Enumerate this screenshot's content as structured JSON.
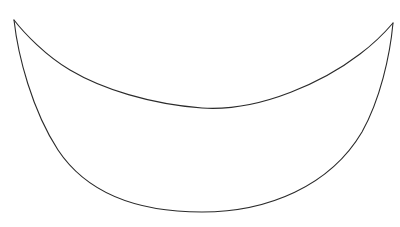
{
  "image": {
    "kind": "line-drawing",
    "subject": "crescent-lens-shape",
    "width": 400,
    "height": 227,
    "background_color": "#ffffff",
    "stroke_color": "#2b2b2b",
    "stroke_color_light": "#555555",
    "stroke_width": 1.1,
    "text_content": "",
    "has_text": false
  },
  "shape": {
    "name": "crescent",
    "description": "Two arcs meeting at sharp cusps at upper-left and upper-right, forming an open crescent / boat outline",
    "cusp_left": {
      "x": 14,
      "y": 20
    },
    "cusp_right": {
      "x": 393,
      "y": 23
    },
    "upper_arc": {
      "name": "upper-arc",
      "lowest_point": {
        "x": 202,
        "y": 108
      },
      "kink_point": {
        "x": 70,
        "y": 70
      },
      "path": "M 14 20 C 24 33, 46 56, 70 70 C 102 89, 150 104, 202 108 C 262 112, 326 80, 360 54 C 376 42, 387 30, 393 23"
    },
    "lower_arc": {
      "name": "lower-arc",
      "lowest_point": {
        "x": 202,
        "y": 212
      },
      "path": "M 14 20 C 18 56, 32 110, 58 150 C 88 195, 140 212, 202 212 C 268 212, 330 186, 362 132 C 380 100, 390 56, 393 23"
    }
  },
  "chart_data": {
    "type": "line",
    "title": "",
    "xlabel": "",
    "ylabel": "",
    "grid": false,
    "legend": "none",
    "xlim": [
      0,
      400
    ],
    "ylim": [
      227,
      0
    ],
    "series": [
      {
        "name": "upper-arc",
        "x": [
          14,
          40,
          70,
          110,
          155,
          202,
          250,
          300,
          340,
          370,
          393
        ],
        "y": [
          20,
          50,
          70,
          87,
          100,
          108,
          106,
          92,
          68,
          44,
          23
        ]
      },
      {
        "name": "lower-arc",
        "x": [
          14,
          32,
          58,
          95,
          150,
          202,
          255,
          305,
          345,
          375,
          393
        ],
        "y": [
          20,
          92,
          150,
          188,
          207,
          212,
          209,
          191,
          155,
          95,
          23
        ]
      }
    ]
  }
}
